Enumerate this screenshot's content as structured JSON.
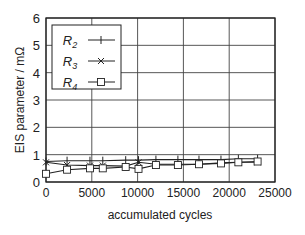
{
  "chart_data": {
    "type": "line",
    "title": "",
    "xlabel": "accumulated cycles",
    "ylabel": "EIS parameter / mΩ",
    "xlim": [
      0,
      25000
    ],
    "ylim": [
      0,
      6
    ],
    "xticks": [
      0,
      5000,
      10000,
      15000,
      20000,
      25000
    ],
    "yticks": [
      0,
      1,
      2,
      3,
      4,
      5,
      6
    ],
    "grid": true,
    "legend_position": "upper left",
    "x": [
      0,
      2300,
      4800,
      6200,
      8700,
      10100,
      12000,
      14400,
      16700,
      19100,
      21000,
      23100
    ],
    "series": [
      {
        "name": "R2",
        "marker": "+",
        "values": [
          0.75,
          0.78,
          0.78,
          0.78,
          0.8,
          0.8,
          0.82,
          0.82,
          0.82,
          0.82,
          0.85,
          0.85
        ]
      },
      {
        "name": "R3",
        "marker": "x",
        "values": [
          0.72,
          0.62,
          0.6,
          0.6,
          0.58,
          0.72,
          0.65,
          0.65,
          0.65,
          0.7,
          0.72,
          0.72
        ]
      },
      {
        "name": "R4",
        "marker": "square",
        "values": [
          0.3,
          0.45,
          0.5,
          0.5,
          0.55,
          0.48,
          0.62,
          0.62,
          0.65,
          0.68,
          0.72,
          0.75
        ]
      }
    ]
  }
}
